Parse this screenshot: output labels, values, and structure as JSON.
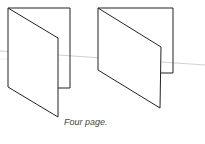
{
  "figure": {
    "caption": "Four page.",
    "stroke_color": "#222222",
    "guide_line_color": "#aaaaaa"
  }
}
